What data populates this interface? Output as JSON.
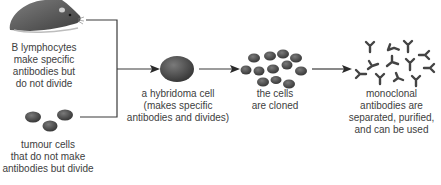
{
  "diagram": {
    "type": "flow",
    "nodes": [
      {
        "id": "b-lymphocytes",
        "icon": "mouse-icon",
        "label_lines": [
          "B lymphocytes",
          "make specific",
          "antibodies but",
          "do not divide"
        ]
      },
      {
        "id": "tumour-cells",
        "icon": "tumour-cells-icon",
        "label_lines": [
          "tumour cells",
          "that do not make",
          "antibodies but divide"
        ]
      },
      {
        "id": "hybridoma",
        "icon": "hybridoma-cell-icon",
        "label_lines": [
          "a hybridoma cell",
          "(makes specific",
          "antibodies and divides)"
        ]
      },
      {
        "id": "cloned",
        "icon": "cloned-cells-icon",
        "label_lines": [
          "the cells",
          "are cloned"
        ]
      },
      {
        "id": "monoclonal",
        "icon": "antibodies-icon",
        "label_lines": [
          "monoclonal",
          "antibodies are",
          "separated, purified,",
          "and can be used"
        ]
      }
    ],
    "edges": [
      {
        "from": "b-lymphocytes",
        "to": "hybridoma"
      },
      {
        "from": "tumour-cells",
        "to": "hybridoma"
      },
      {
        "from": "hybridoma",
        "to": "cloned"
      },
      {
        "from": "cloned",
        "to": "monoclonal"
      }
    ],
    "colors": {
      "line": "#3a3a3a",
      "cell": "#4a4a4a",
      "mouse": "#5a5a5a",
      "text": "#404040"
    }
  }
}
